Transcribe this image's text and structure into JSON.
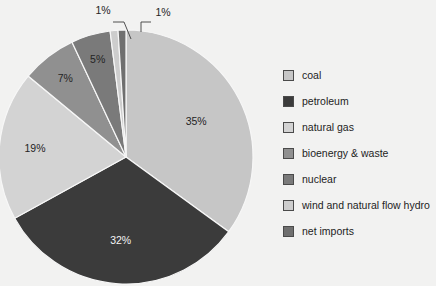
{
  "background_color": "#f2f2f1",
  "chart_data": {
    "type": "pie",
    "title": "",
    "labels": [
      "coal",
      "petroleum",
      "natural gas",
      "bioenergy & waste",
      "nuclear",
      "wind and natural flow hydro",
      "net imports"
    ],
    "values": [
      35,
      32,
      19,
      7,
      5,
      1,
      1
    ],
    "value_labels": [
      "35%",
      "32%",
      "19%",
      "7%",
      "5%",
      "1%",
      "1%"
    ],
    "unit": "%",
    "colors": [
      "#c6c6c6",
      "#3b3b3b",
      "#d3d3d3",
      "#909090",
      "#7a7a7a",
      "#cdcdcd",
      "#6f6f6f"
    ],
    "label_text_colors": [
      "#242424",
      "#f4f4f4",
      "#242424",
      "#242424",
      "#242424",
      "#242424",
      "#242424"
    ],
    "start_angle_deg": 0,
    "direction": "clockwise",
    "legend_position": "right",
    "grid": false,
    "callout_slices": [
      "wind and natural flow hydro",
      "net imports"
    ]
  },
  "legend": {
    "items": [
      {
        "label": "coal",
        "color": "#c6c6c6"
      },
      {
        "label": "petroleum",
        "color": "#3b3b3b"
      },
      {
        "label": "natural gas",
        "color": "#d3d3d3"
      },
      {
        "label": "bioenergy & waste",
        "color": "#909090"
      },
      {
        "label": "nuclear",
        "color": "#7a7a7a"
      },
      {
        "label": "wind and natural flow hydro",
        "color": "#cdcdcd"
      },
      {
        "label": "net imports",
        "color": "#6f6f6f"
      }
    ]
  },
  "slice_labels": {
    "coal": "35%",
    "petroleum": "32%",
    "natural_gas": "19%",
    "bioenergy": "7%",
    "nuclear": "5%",
    "wind": "1%",
    "net_imports": "1%"
  }
}
